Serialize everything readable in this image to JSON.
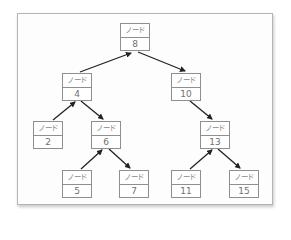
{
  "diagram": {
    "type": "binary-search-tree",
    "node_label": "ノード",
    "nodes": [
      {
        "id": "n8",
        "label": "ノード",
        "value": "8",
        "x": 120,
        "y": 23
      },
      {
        "id": "n4",
        "label": "ノード",
        "value": "4",
        "x": 62,
        "y": 73
      },
      {
        "id": "n10",
        "label": "ノード",
        "value": "10",
        "x": 171,
        "y": 73
      },
      {
        "id": "n2",
        "label": "ノード",
        "value": "2",
        "x": 33,
        "y": 121
      },
      {
        "id": "n6",
        "label": "ノード",
        "value": "6",
        "x": 91,
        "y": 121
      },
      {
        "id": "n13",
        "label": "ノード",
        "value": "13",
        "x": 200,
        "y": 121
      },
      {
        "id": "n5",
        "label": "ノード",
        "value": "5",
        "x": 62,
        "y": 170
      },
      {
        "id": "n7",
        "label": "ノード",
        "value": "7",
        "x": 119,
        "y": 170
      },
      {
        "id": "n11",
        "label": "ノード",
        "value": "11",
        "x": 171,
        "y": 170
      },
      {
        "id": "n15",
        "label": "ノード",
        "value": "15",
        "x": 229,
        "y": 170
      }
    ],
    "edges": [
      {
        "from": "4",
        "to": "8"
      },
      {
        "from": "8",
        "to": "10"
      },
      {
        "from": "2",
        "to": "4"
      },
      {
        "from": "4",
        "to": "6"
      },
      {
        "from": "10",
        "to": "13"
      },
      {
        "from": "5",
        "to": "6"
      },
      {
        "from": "6",
        "to": "7"
      },
      {
        "from": "11",
        "to": "13"
      },
      {
        "from": "13",
        "to": "15"
      }
    ],
    "colors": {
      "edge": "#222222",
      "node_border": "#8f8f8f",
      "node_text": "#7a7a7a",
      "frame_border": "#b5b5b5"
    }
  }
}
